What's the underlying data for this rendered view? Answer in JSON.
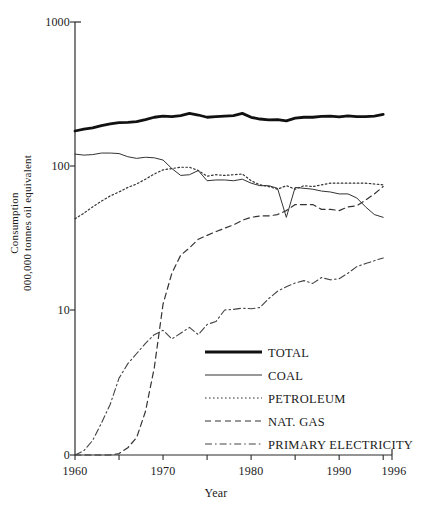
{
  "chart_data": {
    "type": "line",
    "title": "",
    "xlabel": "Year",
    "ylabel_line1": "Consumption",
    "ylabel_line2": "000,000 tonnes oil equivalent",
    "xlim": [
      1960,
      1996
    ],
    "ylim_log": [
      10,
      1000
    ],
    "y_scale": "log-with-zero-baseline",
    "grid": false,
    "legend_position": "inside-bottom-right",
    "x_tick_labels": [
      "1960",
      "1970",
      "1980",
      "1990",
      "1996"
    ],
    "x_tick_values": [
      1960,
      1970,
      1980,
      1990,
      1996
    ],
    "x_minor_ticks": [
      1965,
      1975,
      1985,
      1995
    ],
    "y_tick_labels": [
      "1000",
      "100",
      "10",
      "0"
    ],
    "y_tick_values": [
      1000,
      100,
      10,
      0
    ],
    "years": [
      1960,
      1961,
      1962,
      1963,
      1964,
      1965,
      1966,
      1967,
      1968,
      1969,
      1970,
      1971,
      1972,
      1973,
      1974,
      1975,
      1976,
      1977,
      1978,
      1979,
      1980,
      1981,
      1982,
      1983,
      1984,
      1985,
      1986,
      1987,
      1988,
      1989,
      1990,
      1991,
      1992,
      1993,
      1994,
      1995
    ],
    "series": [
      {
        "name": "TOTAL",
        "style": "thick-solid",
        "color": "#111111",
        "values": [
          175,
          180,
          184,
          191,
          196,
          200,
          201,
          203,
          210,
          218,
          222,
          220,
          224,
          232,
          226,
          218,
          220,
          222,
          224,
          232,
          218,
          212,
          209,
          210,
          206,
          215,
          218,
          218,
          221,
          222,
          219,
          223,
          220,
          220,
          222,
          228
        ]
      },
      {
        "name": "COAL",
        "style": "thin-solid",
        "color": "#333333",
        "values": [
          121,
          119,
          120,
          123,
          123,
          122,
          116,
          113,
          115,
          114,
          110,
          96,
          86,
          87,
          93,
          79,
          80,
          80,
          79,
          81,
          76,
          73,
          73,
          70,
          44,
          71,
          70,
          69,
          67,
          66,
          64,
          64,
          60,
          52,
          46,
          44
        ]
      },
      {
        "name": "PETROLEUM",
        "style": "dotted",
        "color": "#333333",
        "values": [
          43,
          47,
          52,
          57,
          62,
          66,
          71,
          75,
          81,
          88,
          94,
          96,
          98,
          98,
          93,
          85,
          87,
          86,
          87,
          88,
          79,
          74,
          72,
          69,
          73,
          69,
          73,
          72,
          74,
          76,
          76,
          76,
          76,
          76,
          75,
          74
        ]
      },
      {
        "name": "NAT. GAS",
        "style": "dashed",
        "color": "#333333",
        "values": [
          0,
          0,
          0,
          0,
          0,
          0.1,
          0.5,
          1.2,
          3,
          6,
          11,
          18,
          24,
          27,
          31,
          33,
          35,
          37,
          39,
          42,
          44,
          45,
          45,
          46,
          49,
          54,
          54,
          54,
          50,
          50,
          49,
          52,
          53,
          58,
          64,
          72
        ]
      },
      {
        "name": "PRIMARY ELECTRICITY",
        "style": "dash-dot",
        "color": "#444444",
        "values": [
          0,
          0.3,
          1.0,
          2.2,
          3.5,
          5.3,
          6.3,
          7.0,
          7.7,
          8.3,
          8.6,
          8.0,
          8.4,
          8.8,
          8.3,
          9.0,
          9.2,
          10.0,
          10.1,
          10.3,
          10.2,
          10.4,
          12.0,
          13.5,
          14.5,
          15.4,
          16.0,
          15.3,
          16.8,
          16.2,
          16.5,
          18.0,
          20.0,
          21.0,
          22.0,
          23.0
        ]
      }
    ]
  },
  "legend": {
    "items": [
      {
        "label": "TOTAL"
      },
      {
        "label": "COAL"
      },
      {
        "label": "PETROLEUM"
      },
      {
        "label": "NAT. GAS"
      },
      {
        "label": "PRIMARY ELECTRICITY"
      }
    ]
  }
}
